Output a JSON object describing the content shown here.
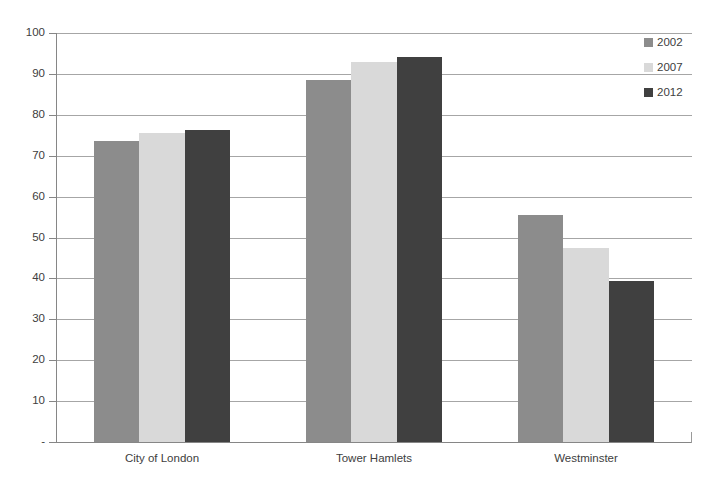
{
  "chart": {
    "title": "",
    "background_color": "#ffffff",
    "gridline_color": "#a6a6a6",
    "axis_color": "#868686",
    "text_color": "#404040"
  },
  "y_axis": {
    "label": "",
    "tick_labels": [
      "100",
      "90",
      "80",
      "70",
      "60",
      "50",
      "40",
      "30",
      "20",
      "10",
      "-"
    ],
    "min": 0,
    "max": 100
  },
  "x_axis": {
    "label": "",
    "tick_labels": [
      "City of London",
      "Tower Hamlets",
      "Westminster"
    ]
  },
  "legend": {
    "position": "top-right",
    "entries": [
      {
        "label": "2002",
        "color": "#8c8c8c"
      },
      {
        "label": "2007",
        "color": "#d9d9d9"
      },
      {
        "label": "2012",
        "color": "#404040"
      }
    ]
  },
  "chart_data": {
    "type": "bar",
    "title": "",
    "xlabel": "",
    "ylabel": "",
    "ylim": [
      0,
      100
    ],
    "grid": true,
    "legend_position": "top-right",
    "categories": [
      "City of London",
      "Tower Hamlets",
      "Westminster"
    ],
    "series": [
      {
        "name": "2002",
        "color": "#8c8c8c",
        "values": [
          73.5,
          88.5,
          55.5
        ]
      },
      {
        "name": "2007",
        "color": "#d9d9d9",
        "values": [
          75.5,
          93.0,
          47.5
        ]
      },
      {
        "name": "2012",
        "color": "#404040",
        "values": [
          76.3,
          94.2,
          39.3
        ]
      }
    ]
  }
}
